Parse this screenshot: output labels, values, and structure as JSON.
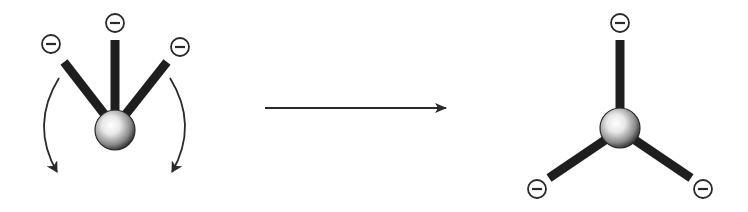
{
  "diagram": {
    "colors": {
      "background": "#ffffff",
      "stick": "#1e1e1e",
      "outline": "#2a2a2a",
      "sphere_highlight": "#ffffff",
      "sphere_shadow": "#3a3a3a",
      "arrow": "#2a2a2a"
    },
    "charge_symbol": "−",
    "before": {
      "label": "Initial arrangement (charges crowded on one side)",
      "center": {
        "x": 115,
        "y": 130,
        "r": 20
      },
      "charges": [
        {
          "id": "left",
          "x": 51,
          "y": 44,
          "stick_end": {
            "x": 64,
            "y": 62
          }
        },
        {
          "id": "top",
          "x": 115,
          "y": 23,
          "stick_end": {
            "x": 115,
            "y": 40
          }
        },
        {
          "id": "right",
          "x": 180,
          "y": 47,
          "stick_end": {
            "x": 167,
            "y": 62
          }
        }
      ],
      "rotation_arrows": [
        {
          "id": "left",
          "direction": "counterclockwise-down"
        },
        {
          "id": "right",
          "direction": "clockwise-down"
        }
      ]
    },
    "transition_arrow": {
      "label": "rearranges to",
      "x1": 265,
      "y1": 108,
      "x2": 446,
      "y2": 108
    },
    "after": {
      "label": "Final arrangement (trigonal planar, 120° apart)",
      "center": {
        "x": 620,
        "y": 128,
        "r": 20
      },
      "charges": [
        {
          "id": "top",
          "x": 620,
          "y": 23,
          "stick_end": {
            "x": 620,
            "y": 40
          }
        },
        {
          "id": "bottom-left",
          "x": 537,
          "y": 189,
          "stick_end": {
            "x": 549,
            "y": 178
          }
        },
        {
          "id": "bottom-right",
          "x": 703,
          "y": 189,
          "stick_end": {
            "x": 691,
            "y": 178
          }
        }
      ]
    }
  }
}
